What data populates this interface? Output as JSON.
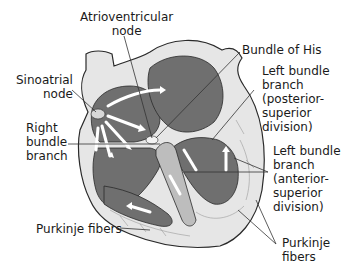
{
  "diagram": {
    "colors": {
      "chamber": "#6f6f6f",
      "wall": "#e6e6e6",
      "outline": "#2a2a2a",
      "arrow": "#ffffff",
      "leader": "#333333",
      "fibers": "#9a9a9a"
    },
    "labels": {
      "av_node": "Atrioventricular\nnode",
      "bundle_his": "Bundle of His",
      "sa_node": "Sinoatrial\nnode",
      "left_post": "Left bundle\nbranch\n(posterior-\nsuperior\ndivision)",
      "right_bundle": "Right\nbundle\nbranch",
      "left_ant": "Left bundle\nbranch\n(anterior-\nsuperior\ndivision)",
      "purkinje_left": "Purkinje fibers",
      "purkinje_right": "Purkinje\nfibers"
    }
  }
}
